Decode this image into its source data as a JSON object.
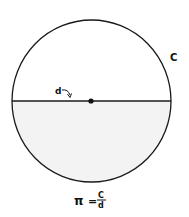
{
  "diagram": {
    "circumference_label": "C",
    "diameter_label": "d",
    "formula": {
      "lhs": "π",
      "equals": "=",
      "numerator": "C",
      "denominator": "d"
    },
    "colors": {
      "stroke": "#1a1a1a",
      "shaded_half": "#f3f3f3",
      "background": "#ffffff"
    }
  }
}
